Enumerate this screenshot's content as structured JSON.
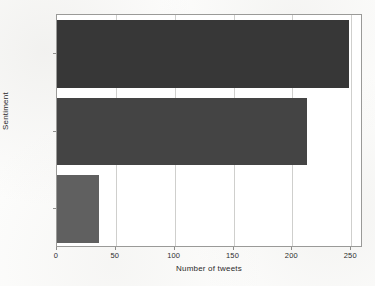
{
  "chart_data": {
    "type": "bar",
    "orientation": "horizontal",
    "title": "",
    "xlabel": "Number of tweets",
    "ylabel": "Sentiment",
    "categories": [
      "negative",
      "positive",
      "neutral"
    ],
    "values": [
      36,
      212,
      248
    ],
    "bars": [
      {
        "category": "neutral",
        "value": 248,
        "color": "#373737"
      },
      {
        "category": "positive",
        "value": 212,
        "color": "#444444"
      },
      {
        "category": "negative",
        "value": 36,
        "color": "#606060"
      }
    ],
    "xlim": [
      0,
      260
    ],
    "ylim": [
      0,
      3
    ],
    "xticks": [
      0,
      50,
      100,
      150,
      200,
      250
    ],
    "xticklabels": [
      "0",
      "50",
      "100",
      "150",
      "200",
      "250"
    ],
    "yticklabels": [
      "neutral",
      "positive",
      "negative"
    ],
    "grid": "vertical-only",
    "gridlines": [
      50,
      100,
      150,
      200,
      250
    ],
    "legend": "none",
    "frame_color": "#9a9a98",
    "grid_color": "#cfcfcd",
    "background": "#ffffff"
  }
}
